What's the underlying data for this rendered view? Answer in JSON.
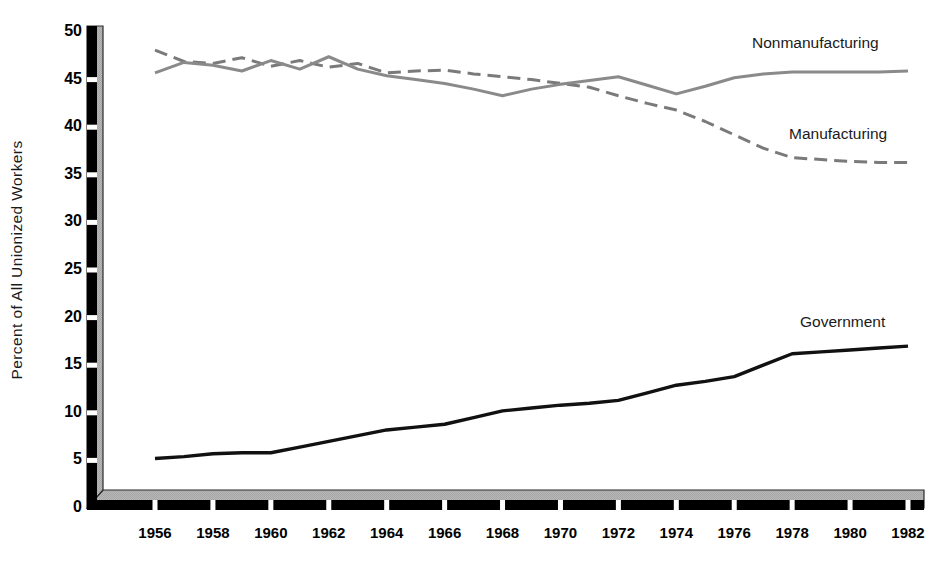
{
  "chart_data": {
    "type": "line",
    "title": "",
    "xlabel": "",
    "ylabel": "Percent of All Unionized Workers",
    "ylim": [
      0,
      50
    ],
    "xlim": [
      1956,
      1982
    ],
    "yticks": [
      0,
      5,
      10,
      15,
      20,
      25,
      30,
      35,
      40,
      45,
      50
    ],
    "ytick_labels": [
      "0",
      "5",
      "10",
      "15",
      "20",
      "25",
      "30",
      "35",
      "40",
      "45",
      "50"
    ],
    "xticks": [
      1956,
      1958,
      1960,
      1962,
      1964,
      1966,
      1968,
      1970,
      1972,
      1974,
      1976,
      1978,
      1980,
      1982
    ],
    "xtick_labels": [
      "1956",
      "1958",
      "1960",
      "1962",
      "1964",
      "1966",
      "1968",
      "1970",
      "1972",
      "1974",
      "1976",
      "1978",
      "1980",
      "1982"
    ],
    "grid": false,
    "legend_position": "inline-annotations",
    "x": [
      1956,
      1957,
      1958,
      1959,
      1960,
      1961,
      1962,
      1963,
      1964,
      1965,
      1966,
      1967,
      1968,
      1969,
      1970,
      1971,
      1972,
      1973,
      1974,
      1975,
      1976,
      1977,
      1978,
      1979,
      1980,
      1981,
      1982
    ],
    "series": [
      {
        "name": "Manufacturing",
        "style": "dashed",
        "color": "#7a7a7a",
        "label_text": "Manufacturing",
        "values": [
          48.1,
          46.9,
          46.7,
          47.3,
          46.4,
          47.0,
          46.3,
          46.7,
          45.7,
          45.9,
          46.0,
          45.6,
          45.3,
          45.0,
          44.6,
          44.2,
          43.3,
          42.5,
          41.8,
          40.6,
          39.2,
          37.8,
          36.8,
          36.6,
          36.4,
          36.3,
          36.3
        ]
      },
      {
        "name": "Nonmanufacturing",
        "style": "solid",
        "color": "#8a8a8a",
        "label_text": "Nonmanufacturing",
        "values": [
          45.7,
          46.8,
          46.5,
          45.9,
          47.0,
          46.1,
          47.4,
          46.1,
          45.4,
          45.0,
          44.6,
          44.0,
          43.3,
          44.0,
          44.5,
          44.9,
          45.3,
          44.4,
          43.5,
          44.3,
          45.2,
          45.6,
          45.8,
          45.8,
          45.8,
          45.8,
          45.9
        ]
      },
      {
        "name": "Government",
        "style": "solid",
        "color": "#111111",
        "label_text": "Government",
        "values": [
          5.2,
          5.4,
          5.7,
          5.8,
          5.8,
          6.4,
          7.0,
          7.6,
          8.2,
          8.5,
          8.8,
          9.5,
          10.2,
          10.5,
          10.8,
          11.0,
          11.3,
          12.1,
          12.9,
          13.3,
          13.8,
          15.0,
          16.2,
          16.4,
          16.6,
          16.8,
          17.0
        ]
      }
    ]
  },
  "axis": {
    "y_axis_label": "Percent of All Unionized Workers",
    "colors": {
      "axis_front": "#000000",
      "axis_side": "#b3b3b3",
      "plot_background": "#ffffff",
      "gray_series": "#8a8a8a",
      "black_series": "#111111"
    }
  },
  "annotations": [
    {
      "name": "nonmanufacturing-label",
      "text": "Nonmanufacturing"
    },
    {
      "name": "manufacturing-label",
      "text": "Manufacturing"
    },
    {
      "name": "government-label",
      "text": "Government"
    }
  ]
}
